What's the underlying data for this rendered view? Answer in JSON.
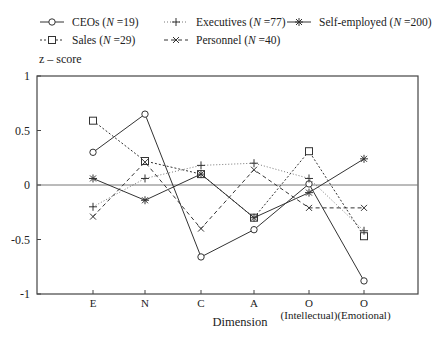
{
  "chart_data": {
    "type": "line",
    "title": "",
    "xlabel": "Dimension",
    "ylabel": "z – score",
    "ylim": [
      -1,
      1
    ],
    "yticks": [
      "1",
      "0.5",
      "0",
      "-0.5",
      "-1"
    ],
    "categories": [
      "E",
      "N",
      "C",
      "A",
      "O (Intellectual)",
      "O (Emotional)"
    ],
    "category_labels": [
      {
        "line1": "E",
        "line2": ""
      },
      {
        "line1": "N",
        "line2": ""
      },
      {
        "line1": "C",
        "line2": ""
      },
      {
        "line1": "A",
        "line2": ""
      },
      {
        "line1": "O",
        "line2": "(Intellectual)"
      },
      {
        "line1": "O",
        "line2": "(Emotional)"
      }
    ],
    "reference_line": 0,
    "legend_position": "top",
    "series": [
      {
        "name": "CEOs (N =19)",
        "label": "CEOs (",
        "n_label": "N",
        "n_value": " =19)",
        "marker": "circle",
        "dash": "solid",
        "values": [
          0.3,
          0.65,
          -0.66,
          -0.41,
          0.01,
          -0.88
        ]
      },
      {
        "name": "Sales (N =29)",
        "label": "Sales (",
        "n_label": "N",
        "n_value": " =29)",
        "marker": "square",
        "dash": "dotted",
        "values": [
          0.59,
          0.22,
          0.1,
          -0.3,
          0.31,
          -0.47
        ]
      },
      {
        "name": "Executives (N =77)",
        "label": "Executives (",
        "n_label": "N",
        "n_value": " =77)",
        "marker": "plus",
        "dash": "dotted-fine",
        "values": [
          -0.2,
          0.06,
          0.18,
          0.2,
          0.06,
          -0.42
        ]
      },
      {
        "name": "Personnel (N =40)",
        "label": "Personnel (",
        "n_label": "N",
        "n_value": " =40)",
        "marker": "cross",
        "dash": "dashed",
        "values": [
          -0.29,
          0.21,
          -0.4,
          0.14,
          -0.21,
          -0.21
        ]
      },
      {
        "name": "Self-employed (N =200)",
        "label": "Self-employed (",
        "n_label": "N",
        "n_value": " =200)",
        "marker": "star",
        "dash": "solid",
        "values": [
          0.06,
          -0.14,
          0.1,
          -0.3,
          -0.07,
          0.24
        ]
      }
    ]
  }
}
